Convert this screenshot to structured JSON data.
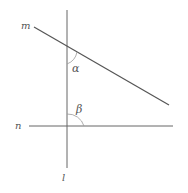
{
  "diagram": {
    "lines": {
      "l": {
        "label": "l",
        "x1": 67,
        "y1": 10,
        "x2": 67,
        "y2": 168
      },
      "m": {
        "label": "m",
        "x1": 34,
        "y1": 27,
        "x2": 169,
        "y2": 105
      },
      "n": {
        "label": "n",
        "x1": 29,
        "y1": 126,
        "x2": 173,
        "y2": 126
      }
    },
    "angles": {
      "alpha": {
        "label": "α"
      },
      "beta": {
        "label": "β"
      }
    },
    "color": "#555555"
  }
}
